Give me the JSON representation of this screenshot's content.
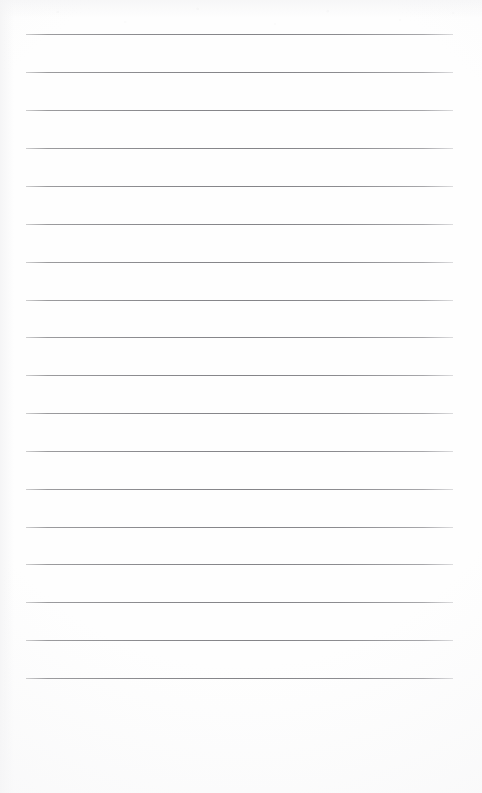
{
  "page": {
    "kind": "lined-notepad-scan",
    "title": "Blank lined notepad page",
    "width": 482,
    "height": 793,
    "background_color": "#fefefe",
    "has_visible_text": false,
    "visible_text": "",
    "orientation": "portrait"
  },
  "ruling": {
    "line_count": 18,
    "line_color": "#8a8a8e",
    "line_thickness_px": 1,
    "line_spacing_px": 37.9,
    "first_line_y": 34,
    "last_line_y": 678,
    "left_margin_x": 26,
    "right_edge_x": 453,
    "line_width_px": 427,
    "lines": [
      {
        "index": 1,
        "y": 34,
        "x1": 26,
        "x2": 453
      },
      {
        "index": 2,
        "y": 72,
        "x1": 26,
        "x2": 453
      },
      {
        "index": 3,
        "y": 110,
        "x1": 26,
        "x2": 453
      },
      {
        "index": 4,
        "y": 148,
        "x1": 26,
        "x2": 453
      },
      {
        "index": 5,
        "y": 186,
        "x1": 26,
        "x2": 453
      },
      {
        "index": 6,
        "y": 224,
        "x1": 26,
        "x2": 453
      },
      {
        "index": 7,
        "y": 262,
        "x1": 26,
        "x2": 453
      },
      {
        "index": 8,
        "y": 300,
        "x1": 26,
        "x2": 453
      },
      {
        "index": 9,
        "y": 337,
        "x1": 26,
        "x2": 453
      },
      {
        "index": 10,
        "y": 375,
        "x1": 26,
        "x2": 453
      },
      {
        "index": 11,
        "y": 413,
        "x1": 26,
        "x2": 453
      },
      {
        "index": 12,
        "y": 451,
        "x1": 26,
        "x2": 453
      },
      {
        "index": 13,
        "y": 489,
        "x1": 26,
        "x2": 453
      },
      {
        "index": 14,
        "y": 527,
        "x1": 26,
        "x2": 453
      },
      {
        "index": 15,
        "y": 564,
        "x1": 26,
        "x2": 453
      },
      {
        "index": 16,
        "y": 602,
        "x1": 26,
        "x2": 453
      },
      {
        "index": 17,
        "y": 640,
        "x1": 26,
        "x2": 453
      },
      {
        "index": 18,
        "y": 678,
        "x1": 26,
        "x2": 453
      }
    ]
  },
  "footer": {
    "blank_area_top_y": 679,
    "blank_area_height_px": 114
  }
}
